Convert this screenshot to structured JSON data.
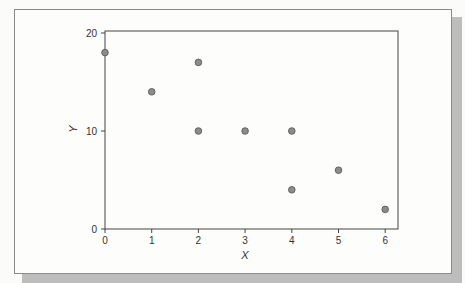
{
  "chart_data": {
    "type": "scatter",
    "title": "",
    "xlabel": "X",
    "ylabel": "Y",
    "xlim": [
      0,
      6.3
    ],
    "ylim": [
      0,
      20.3
    ],
    "x_ticks": [
      0,
      1,
      2,
      3,
      4,
      5,
      6
    ],
    "y_ticks": [
      0,
      10,
      20
    ],
    "grid": false,
    "legend": null,
    "points": [
      {
        "x": 0,
        "y": 18
      },
      {
        "x": 1,
        "y": 14
      },
      {
        "x": 2,
        "y": 17
      },
      {
        "x": 2,
        "y": 10
      },
      {
        "x": 3,
        "y": 10
      },
      {
        "x": 4,
        "y": 10
      },
      {
        "x": 4,
        "y": 4
      },
      {
        "x": 5,
        "y": 6
      },
      {
        "x": 6,
        "y": 2
      }
    ],
    "marker_color": "#8c8c8c",
    "marker_edge": "#5a5a5a"
  }
}
